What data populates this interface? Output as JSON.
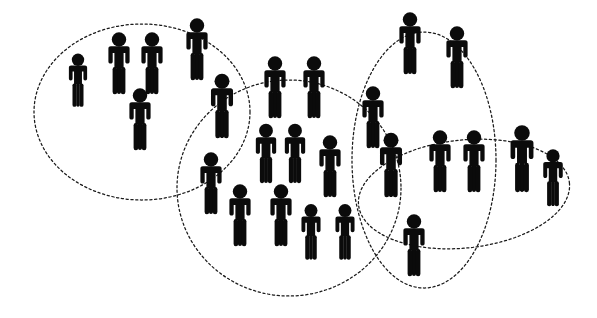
{
  "figure": {
    "background_color": "#ffffff",
    "ink_color": "#0b0b0b",
    "outline_color": "#1a1a1a",
    "canvas": {
      "width": 597,
      "height": 318
    },
    "total_people": 28,
    "total_clusters": 4
  },
  "chart_data": {
    "type": "scatter",
    "xlabel": "",
    "ylabel": "",
    "xlim": [
      0,
      597
    ],
    "ylim": [
      0,
      318
    ],
    "grid": false,
    "legend": "none",
    "marker": "person-pictogram",
    "series": [
      {
        "name": "people",
        "count": 28,
        "points": [
          {
            "id": "p01",
            "x": 78,
            "y": 86,
            "scale": 0.86,
            "cluster": "left"
          },
          {
            "id": "p02",
            "x": 119,
            "y": 70,
            "scale": 1.0,
            "cluster": "left"
          },
          {
            "id": "p03",
            "x": 152,
            "y": 70,
            "scale": 1.0,
            "cluster": "left"
          },
          {
            "id": "p04",
            "x": 197,
            "y": 56,
            "scale": 1.0,
            "cluster": "left"
          },
          {
            "id": "p05",
            "x": 140,
            "y": 126,
            "scale": 1.0,
            "cluster": "left"
          },
          {
            "id": "p06",
            "x": 222,
            "y": 113,
            "scale": 1.04,
            "cluster": "left,middle"
          },
          {
            "id": "p07",
            "x": 275,
            "y": 94,
            "scale": 1.0,
            "cluster": "middle"
          },
          {
            "id": "p08",
            "x": 314,
            "y": 94,
            "scale": 1.0,
            "cluster": "middle"
          },
          {
            "id": "p09",
            "x": 266,
            "y": 160,
            "scale": 0.96,
            "cluster": "middle"
          },
          {
            "id": "p10",
            "x": 295,
            "y": 160,
            "scale": 0.96,
            "cluster": "middle"
          },
          {
            "id": "p11",
            "x": 330,
            "y": 173,
            "scale": 1.0,
            "cluster": "middle"
          },
          {
            "id": "p12",
            "x": 211,
            "y": 190,
            "scale": 1.0,
            "cluster": "middle"
          },
          {
            "id": "p13",
            "x": 240,
            "y": 222,
            "scale": 1.0,
            "cluster": "middle"
          },
          {
            "id": "p14",
            "x": 281,
            "y": 222,
            "scale": 1.0,
            "cluster": "middle"
          },
          {
            "id": "p15",
            "x": 311,
            "y": 238,
            "scale": 0.9,
            "cluster": "middle"
          },
          {
            "id": "p16",
            "x": 345,
            "y": 238,
            "scale": 0.9,
            "cluster": "middle"
          },
          {
            "id": "p17",
            "x": 410,
            "y": 50,
            "scale": 1.0,
            "cluster": "upper-right"
          },
          {
            "id": "p18",
            "x": 457,
            "y": 64,
            "scale": 1.0,
            "cluster": "upper-right"
          },
          {
            "id": "p19",
            "x": 373,
            "y": 124,
            "scale": 1.0,
            "cluster": "middle,upper-right"
          },
          {
            "id": "p20",
            "x": 391,
            "y": 172,
            "scale": 1.04,
            "cluster": "middle,upper-right,right"
          },
          {
            "id": "p21",
            "x": 414,
            "y": 252,
            "scale": 1.0,
            "cluster": "middle,upper-right"
          },
          {
            "id": "p22",
            "x": 440,
            "y": 168,
            "scale": 1.0,
            "cluster": "upper-right,right"
          },
          {
            "id": "p23",
            "x": 474,
            "y": 168,
            "scale": 1.0,
            "cluster": "upper-right,right"
          },
          {
            "id": "p24",
            "x": 522,
            "y": 166,
            "scale": 1.08,
            "cluster": "right"
          },
          {
            "id": "p25",
            "x": 553,
            "y": 184,
            "scale": 0.92,
            "cluster": "right"
          }
        ]
      }
    ],
    "clusters": [
      {
        "id": "left",
        "label": "Left cluster",
        "shape": "ellipse",
        "cx": 142,
        "cy": 112,
        "rx": 108,
        "ry": 88,
        "rotate": 0,
        "members": 6
      },
      {
        "id": "middle",
        "label": "Middle cluster",
        "shape": "ellipse",
        "cx": 289,
        "cy": 188,
        "rx": 112,
        "ry": 108,
        "rotate": 0,
        "members": 13
      },
      {
        "id": "upper-right",
        "label": "Upper right cluster",
        "shape": "ellipse",
        "cx": 424,
        "cy": 160,
        "rx": 72,
        "ry": 128,
        "rotate": 0,
        "members": 7
      },
      {
        "id": "right",
        "label": "Right cluster",
        "shape": "ellipse",
        "cx": 464,
        "cy": 194,
        "rx": 106,
        "ry": 54,
        "rotate": -6,
        "members": 6
      }
    ]
  }
}
